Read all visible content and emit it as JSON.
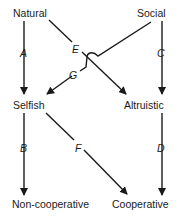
{
  "diagram": {
    "nodes": {
      "natural": "Natural",
      "social": "Social",
      "selfish": "Selfish",
      "altruistic": "Altruistic",
      "noncooperative": "Non-cooperative",
      "cooperative": "Cooperative"
    },
    "edges": {
      "a": {
        "label": "A",
        "from": "Natural",
        "to": "Selfish"
      },
      "b": {
        "label": "B",
        "from": "Selfish",
        "to": "Non-cooperative"
      },
      "c": {
        "label": "C",
        "from": "Social",
        "to": "Altruistic"
      },
      "d": {
        "label": "D",
        "from": "Altruistic",
        "to": "Cooperative"
      },
      "e": {
        "label": "E",
        "from": "Natural",
        "to": "Altruistic"
      },
      "f": {
        "label": "F",
        "from": "Selfish",
        "to": "Cooperative"
      },
      "g": {
        "label": "G",
        "from": "Social",
        "to": "Selfish"
      }
    }
  }
}
